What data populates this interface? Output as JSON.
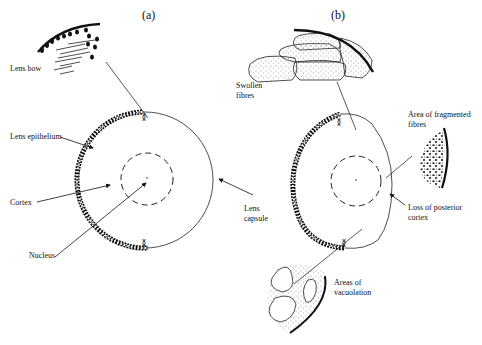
{
  "panels": [
    {
      "id": "a",
      "label": "(a)",
      "labels": {
        "lens_bow": "Lens bow",
        "lens_epithelium": "Lens epithelium",
        "cortex": "Cortex",
        "nucleus": "Nucleus",
        "lens_capsule_1": "Lens",
        "lens_capsule_2": "capsule"
      }
    },
    {
      "id": "b",
      "label": "(b)",
      "labels": {
        "swollen_1": "Swollen",
        "swollen_2": "fibres",
        "fragmented_1": "Area of fragmented",
        "fragmented_2": "fibres",
        "posterior_1": "Loss of posterior",
        "posterior_2": "cortex",
        "vacuolation_1": "Areas of",
        "vacuolation_2": "vacuolation"
      }
    }
  ],
  "colors": {
    "ink": "#111111",
    "background": "#ffffff"
  }
}
